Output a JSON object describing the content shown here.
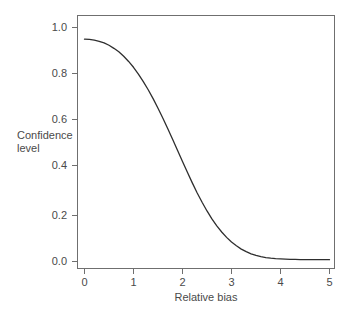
{
  "chart_data": {
    "type": "line",
    "title": "",
    "subtitle": "",
    "xlabel": "Relative bias",
    "ylabel": "Confidence level",
    "ylabel_line1": "Confidence",
    "ylabel_line2": "level",
    "xlim": [
      0,
      5
    ],
    "ylim": [
      0.0,
      1.0
    ],
    "xticks": [
      0,
      1,
      2,
      3,
      4,
      5
    ],
    "xtick_labels": [
      "0",
      "1",
      "2",
      "3",
      "4",
      "5"
    ],
    "yticks": [
      0.0,
      0.2,
      0.4,
      0.6,
      0.8,
      1.0
    ],
    "ytick_labels": [
      "0.0",
      "0.2",
      "0.4",
      "0.6",
      "0.8",
      "1.0"
    ],
    "grid": false,
    "legend": false,
    "legend_position": "none",
    "line_color": "#2e2e2e",
    "frame_color": "#6f6f6f",
    "background_color": "#ffffff",
    "series": [
      {
        "name": "Confidence level",
        "x": [
          0.0,
          0.1,
          0.2,
          0.3,
          0.4,
          0.5,
          0.6,
          0.7,
          0.8,
          0.9,
          1.0,
          1.1,
          1.2,
          1.3,
          1.4,
          1.5,
          1.6,
          1.7,
          1.8,
          1.9,
          2.0,
          2.1,
          2.2,
          2.3,
          2.4,
          2.5,
          2.6,
          2.7,
          2.8,
          2.9,
          3.0,
          3.1,
          3.2,
          3.3,
          3.4,
          3.5,
          3.6,
          3.7,
          3.8,
          3.9,
          4.0,
          4.1,
          4.2,
          4.3,
          4.4,
          4.5,
          4.6,
          4.7,
          4.8,
          4.9,
          5.0
        ],
        "values": [
          0.95,
          0.949,
          0.946,
          0.941,
          0.934,
          0.924,
          0.911,
          0.896,
          0.877,
          0.855,
          0.83,
          0.801,
          0.769,
          0.734,
          0.696,
          0.655,
          0.612,
          0.567,
          0.521,
          0.474,
          0.427,
          0.381,
          0.336,
          0.293,
          0.253,
          0.216,
          0.182,
          0.152,
          0.126,
          0.103,
          0.083,
          0.067,
          0.053,
          0.042,
          0.033,
          0.026,
          0.021,
          0.017,
          0.014,
          0.012,
          0.011,
          0.01,
          0.009,
          0.009,
          0.008,
          0.008,
          0.008,
          0.008,
          0.008,
          0.008,
          0.008
        ]
      }
    ],
    "annotations": []
  }
}
